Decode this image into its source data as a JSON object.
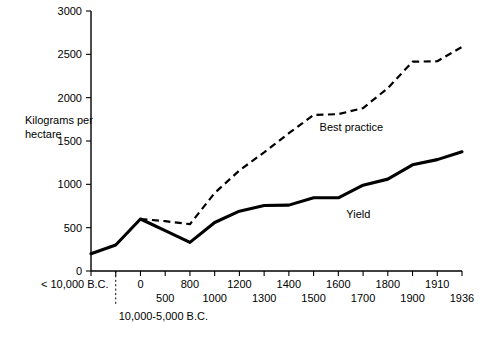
{
  "chart_data": {
    "type": "line",
    "title": "",
    "subtitle": "",
    "xlabel": "",
    "ylabel": "Kilograms per hectare",
    "ylabel_line1": "Kilograms per",
    "ylabel_line2": "hectare",
    "ylim": [
      0,
      3000
    ],
    "ytick_values": [
      0,
      500,
      1000,
      1500,
      2000,
      2500,
      3000
    ],
    "ytick_labels": [
      "0",
      "500",
      "1000",
      "1500",
      "2000",
      "2500",
      "3000"
    ],
    "grid": false,
    "legend_position": "inline-annotation",
    "x_categories": [
      "< 10,000 B.C.",
      "10,000-5,000 B.C.",
      "0",
      "500",
      "800",
      "1000",
      "1200",
      "1300",
      "1400",
      "1500",
      "1600",
      "1700",
      "1800",
      "1900",
      "1910",
      "1936"
    ],
    "xtick_labels_upper": [
      "< 10,000 B.C.",
      "0",
      "800",
      "1200",
      "1400",
      "1600",
      "1800",
      "1910"
    ],
    "xtick_labels_lower": [
      "500",
      "1000",
      "1300",
      "1500",
      "1700",
      "1900",
      "1936"
    ],
    "era_note": "10,000-5,000 B.C.",
    "series": [
      {
        "name": "Yield",
        "style": "solid",
        "label": "Yield",
        "values": [
          200,
          300,
          600,
          465,
          330,
          560,
          690,
          755,
          760,
          845,
          845,
          990,
          1060,
          1225,
          1285,
          1375
        ]
      },
      {
        "name": "Best practice",
        "style": "dashed",
        "label": "Best practice",
        "values": [
          null,
          null,
          600,
          575,
          540,
          900,
          1160,
          1370,
          1590,
          1800,
          1810,
          1880,
          2110,
          2415,
          2420,
          2585
        ]
      }
    ],
    "annotations": [
      {
        "text": "Best practice",
        "x_category": "1500",
        "value": 1680
      },
      {
        "text": "Yield",
        "x_category": "1600",
        "value": 680
      }
    ],
    "colors": {
      "axis": "#000000",
      "yield_line": "#000000",
      "best_practice_line": "#000000",
      "background": "#ffffff"
    }
  },
  "layout": {
    "plot_left": 91,
    "plot_right": 462,
    "plot_top": 11,
    "plot_bottom": 271
  }
}
